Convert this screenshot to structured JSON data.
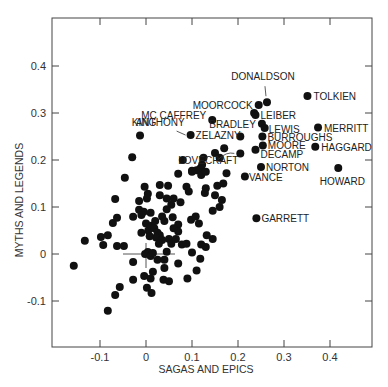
{
  "chart_data": {
    "type": "scatter",
    "title": "",
    "xlabel": "SAGAS AND EPICS",
    "ylabel": "MYTHS AND LEGENDS",
    "xlim": [
      -0.2,
      0.495
    ],
    "ylim": [
      -0.2,
      0.5
    ],
    "x_ticks": [
      -0.1,
      0,
      0.1,
      0.2,
      0.3,
      0.4
    ],
    "x_tick_labels": [
      "-0.1",
      "0",
      "0.1",
      "0.2",
      "0.3",
      "0.4"
    ],
    "y_ticks": [
      -0.1,
      0,
      0.1,
      0.2,
      0.3,
      0.4
    ],
    "y_tick_labels": [
      "-0.1",
      "0",
      "0.1",
      "0.2",
      "0.3",
      "0.4"
    ],
    "grid": false,
    "legend": null,
    "origin_crosshair": true,
    "labeled_points": [
      {
        "name": "DONALDSON",
        "x": 0.263,
        "y": 0.323,
        "label_dx": -4,
        "label_dy": -22,
        "anchor": "middle",
        "arrow": true
      },
      {
        "name": "TOLKIEN",
        "x": 0.351,
        "y": 0.336,
        "label_dx": 6,
        "label_dy": 4,
        "anchor": "start"
      },
      {
        "name": "MOORCOCK",
        "x": 0.245,
        "y": 0.317,
        "label_dx": -6,
        "label_dy": 4,
        "anchor": "end"
      },
      {
        "name": "LEIBER",
        "x": 0.238,
        "y": 0.296,
        "label_dx": 5,
        "label_dy": 4,
        "anchor": "start"
      },
      {
        "name": "MC CAFFREY",
        "x": 0.144,
        "y": 0.285,
        "label_dx": -6,
        "label_dy": -1,
        "anchor": "end"
      },
      {
        "name": "BRADLEY",
        "x": 0.252,
        "y": 0.277,
        "label_dx": -6,
        "label_dy": 4,
        "anchor": "end"
      },
      {
        "name": "LEWIS",
        "x": 0.258,
        "y": 0.268,
        "label_dx": 4,
        "label_dy": 5,
        "anchor": "start"
      },
      {
        "name": "MERRITT",
        "x": 0.374,
        "y": 0.269,
        "label_dx": 6,
        "label_dy": 4,
        "anchor": "start"
      },
      {
        "name": "KING",
        "x": -0.013,
        "y": 0.252,
        "label_dx": 4,
        "label_dy": -10,
        "anchor": "middle"
      },
      {
        "name": "ANTHONY",
        "x": 0.097,
        "y": 0.253,
        "label_dx": -6,
        "label_dy": -9,
        "anchor": "end"
      },
      {
        "name": "ZELAZNY",
        "x": 0.097,
        "y": 0.253,
        "label_dx": 5,
        "label_dy": 4,
        "anchor": "start",
        "hide_dot": true
      },
      {
        "name": "BURROUGHS",
        "x": 0.253,
        "y": 0.25,
        "label_dx": 5,
        "label_dy": 4,
        "anchor": "start"
      },
      {
        "name": "MOORE",
        "x": 0.254,
        "y": 0.231,
        "label_dx": 5,
        "label_dy": 4,
        "anchor": "start"
      },
      {
        "name": "HAGGARD",
        "x": 0.368,
        "y": 0.228,
        "label_dx": 6,
        "label_dy": 4,
        "anchor": "start"
      },
      {
        "name": "DECAMP",
        "x": 0.238,
        "y": 0.222,
        "label_dx": 5,
        "label_dy": 8,
        "anchor": "start"
      },
      {
        "name": "LOVECRAFT",
        "x": 0.205,
        "y": 0.214,
        "label_dx": -2,
        "label_dy": 11,
        "anchor": "end",
        "arrow": true
      },
      {
        "name": "NORTON",
        "x": 0.25,
        "y": 0.185,
        "label_dx": 5,
        "label_dy": 4,
        "anchor": "start"
      },
      {
        "name": "HOWARD",
        "x": 0.418,
        "y": 0.183,
        "label_dx": 4,
        "label_dy": 17,
        "anchor": "middle"
      },
      {
        "name": "VANCE",
        "x": 0.215,
        "y": 0.165,
        "label_dx": 4,
        "label_dy": 5,
        "anchor": "start"
      },
      {
        "name": "GARRETT",
        "x": 0.24,
        "y": 0.076,
        "label_dx": 5,
        "label_dy": 4,
        "anchor": "start"
      }
    ],
    "points": [
      [
        -0.157,
        -0.025
      ],
      [
        -0.133,
        0.028
      ],
      [
        -0.098,
        0.036
      ],
      [
        -0.093,
        0.019
      ],
      [
        -0.083,
        0.04
      ],
      [
        -0.067,
        0.117
      ],
      [
        -0.072,
        0.066
      ],
      [
        -0.063,
        0.077
      ],
      [
        -0.063,
        0.017
      ],
      [
        -0.048,
        0.017
      ],
      [
        -0.046,
        0.162
      ],
      [
        -0.03,
        0.206
      ],
      [
        -0.015,
        0.113
      ],
      [
        -0.015,
        0.094
      ],
      [
        -0.028,
        0.079
      ],
      [
        -0.028,
        -0.017
      ],
      [
        -0.028,
        -0.055
      ],
      [
        -0.067,
        -0.087
      ],
      [
        -0.057,
        -0.07
      ],
      [
        -0.083,
        -0.121
      ],
      [
        -0.003,
        0.143
      ],
      [
        0.004,
        0.128
      ],
      [
        0.002,
        0.118
      ],
      [
        -0.005,
        0.09
      ],
      [
        0.01,
        0.088
      ],
      [
        -0.01,
        0.083
      ],
      [
        0.0,
        0.065
      ],
      [
        0.005,
        0.05
      ],
      [
        0.012,
        0.06
      ],
      [
        0.018,
        0.055
      ],
      [
        0.025,
        0.045
      ],
      [
        0.03,
        0.04
      ],
      [
        0.022,
        0.035
      ],
      [
        0.008,
        0.038
      ],
      [
        0.035,
        0.03
      ],
      [
        0.028,
        0.022
      ],
      [
        0.004,
        0.004
      ],
      [
        -0.002,
        0.0
      ],
      [
        0.01,
        -0.004
      ],
      [
        0.015,
        0.002
      ],
      [
        0.025,
        -0.012
      ],
      [
        0.04,
        -0.012
      ],
      [
        0.002,
        -0.072
      ],
      [
        0.012,
        -0.083
      ],
      [
        -0.004,
        -0.047
      ],
      [
        0.01,
        -0.052
      ],
      [
        0.015,
        -0.038
      ],
      [
        0.04,
        -0.03
      ],
      [
        0.038,
        -0.055
      ],
      [
        0.05,
        -0.058
      ],
      [
        0.03,
        0.147
      ],
      [
        0.048,
        0.145
      ],
      [
        0.045,
        0.118
      ],
      [
        0.06,
        0.118
      ],
      [
        0.03,
        0.125
      ],
      [
        0.055,
        0.105
      ],
      [
        0.045,
        0.095
      ],
      [
        0.04,
        0.07
      ],
      [
        0.058,
        0.078
      ],
      [
        0.07,
        0.063
      ],
      [
        0.06,
        0.055
      ],
      [
        0.05,
        0.032
      ],
      [
        0.055,
        0.022
      ],
      [
        0.07,
        0.048
      ],
      [
        0.078,
        0.02
      ],
      [
        0.088,
        0.022
      ],
      [
        0.07,
        -0.02
      ],
      [
        0.09,
        -0.052
      ],
      [
        0.1,
        0.003
      ],
      [
        0.11,
        -0.035
      ],
      [
        0.118,
        -0.01
      ],
      [
        0.12,
        0.02
      ],
      [
        0.13,
        0.015
      ],
      [
        0.145,
        0.032
      ],
      [
        0.132,
        0.04
      ],
      [
        0.098,
        0.073
      ],
      [
        0.108,
        0.08
      ],
      [
        0.115,
        0.065
      ],
      [
        0.145,
        0.092
      ],
      [
        0.16,
        0.1
      ],
      [
        0.075,
        0.11
      ],
      [
        0.088,
        0.143
      ],
      [
        0.093,
        0.133
      ],
      [
        0.07,
        0.171
      ],
      [
        0.08,
        0.2
      ],
      [
        0.1,
        0.177
      ],
      [
        0.11,
        0.178
      ],
      [
        0.118,
        0.182
      ],
      [
        0.12,
        0.168
      ],
      [
        0.122,
        0.19
      ],
      [
        0.125,
        0.205
      ],
      [
        0.13,
        0.14
      ],
      [
        0.128,
        0.13
      ],
      [
        0.15,
        0.125
      ],
      [
        0.155,
        0.145
      ],
      [
        0.165,
        0.115
      ],
      [
        0.168,
        0.15
      ],
      [
        0.175,
        0.172
      ],
      [
        0.15,
        0.215
      ],
      [
        0.17,
        0.225
      ],
      [
        0.205,
        0.25
      ],
      [
        0.235,
        0.3
      ],
      [
        0.1,
        0.175
      ],
      [
        0.13,
        0.175
      ],
      [
        0.16,
        0.205
      ],
      [
        0.035,
        0.08
      ],
      [
        0.02,
        0.07
      ],
      [
        0.065,
        0.032
      ],
      [
        -0.01,
        0.045
      ],
      [
        0.045,
        0.005
      ]
    ]
  },
  "chart_colors": {
    "ink": "#111111",
    "frame": "#444444",
    "background": "#ffffff"
  }
}
